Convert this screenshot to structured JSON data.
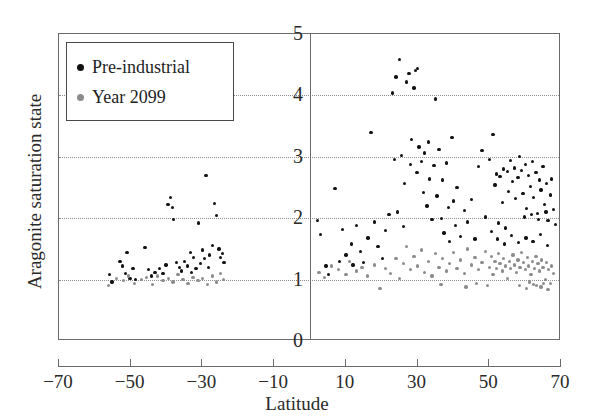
{
  "chart_data": {
    "type": "scatter",
    "title": "",
    "xlabel": "Latitude",
    "ylabel": "Aragonite saturation state",
    "xlim": [
      -70,
      70
    ],
    "ylim": [
      0,
      5
    ],
    "xticks": [
      -70,
      -50,
      -30,
      -10,
      10,
      30,
      50,
      70
    ],
    "yticks": [
      0,
      1,
      2,
      3,
      4,
      5
    ],
    "grid": "horizontal-dotted",
    "gridlines_y": [
      1,
      2,
      3,
      4
    ],
    "legend_position": "top-left-inside",
    "vertical_reference_line_x": 0,
    "series": [
      {
        "name": "Pre-industrial",
        "color": "#121212",
        "points": [
          [
            -56.0,
            1.08
          ],
          [
            -55.2,
            0.96
          ],
          [
            -53.0,
            1.3
          ],
          [
            -52.2,
            1.22
          ],
          [
            -51.4,
            1.1
          ],
          [
            -51.0,
            1.44
          ],
          [
            -50.2,
            1.02
          ],
          [
            -49.4,
            1.18
          ],
          [
            -48.6,
            1.0
          ],
          [
            -46.0,
            1.52
          ],
          [
            -45.0,
            1.16
          ],
          [
            -44.2,
            1.06
          ],
          [
            -43.2,
            1.12
          ],
          [
            -42.0,
            1.18
          ],
          [
            -41.0,
            1.1
          ],
          [
            -40.2,
            1.24
          ],
          [
            -39.6,
            2.22
          ],
          [
            -39.0,
            2.34
          ],
          [
            -38.4,
            2.18
          ],
          [
            -38.0,
            1.98
          ],
          [
            -37.2,
            1.28
          ],
          [
            -36.4,
            1.2
          ],
          [
            -35.8,
            1.14
          ],
          [
            -35.0,
            1.3
          ],
          [
            -34.2,
            1.22
          ],
          [
            -33.4,
            1.44
          ],
          [
            -33.0,
            1.12
          ],
          [
            -32.4,
            1.36
          ],
          [
            -31.8,
            1.18
          ],
          [
            -31.0,
            1.92
          ],
          [
            -30.6,
            1.26
          ],
          [
            -30.0,
            1.48
          ],
          [
            -29.4,
            1.34
          ],
          [
            -29.0,
            2.7
          ],
          [
            -28.4,
            1.2
          ],
          [
            -28.0,
            1.4
          ],
          [
            -27.2,
            1.56
          ],
          [
            -26.6,
            2.24
          ],
          [
            -26.0,
            2.04
          ],
          [
            -25.4,
            1.5
          ],
          [
            -25.0,
            1.36
          ],
          [
            -24.4,
            1.42
          ],
          [
            -24.0,
            1.28
          ],
          [
            2.0,
            1.96
          ],
          [
            3.0,
            1.74
          ],
          [
            4.5,
            1.22
          ],
          [
            5.2,
            1.08
          ],
          [
            7.0,
            2.48
          ],
          [
            8.2,
            1.3
          ],
          [
            9.0,
            1.82
          ],
          [
            10.0,
            1.4
          ],
          [
            11.5,
            1.58
          ],
          [
            12.0,
            1.24
          ],
          [
            13.0,
            1.88
          ],
          [
            14.0,
            1.46
          ],
          [
            15.0,
            1.28
          ],
          [
            16.2,
            1.68
          ],
          [
            17.0,
            3.4
          ],
          [
            18.0,
            1.94
          ],
          [
            19.0,
            1.54
          ],
          [
            20.2,
            1.34
          ],
          [
            21.0,
            1.8
          ],
          [
            22.0,
            2.06
          ],
          [
            23.0,
            4.04
          ],
          [
            23.6,
            2.96
          ],
          [
            24.0,
            4.3
          ],
          [
            24.4,
            2.1
          ],
          [
            25.0,
            4.58
          ],
          [
            25.6,
            3.02
          ],
          [
            26.0,
            1.86
          ],
          [
            26.4,
            2.56
          ],
          [
            27.0,
            4.22
          ],
          [
            27.6,
            4.36
          ],
          [
            28.0,
            2.88
          ],
          [
            28.4,
            3.28
          ],
          [
            29.0,
            4.12
          ],
          [
            29.4,
            4.4
          ],
          [
            29.8,
            2.74
          ],
          [
            30.0,
            4.44
          ],
          [
            30.4,
            3.16
          ],
          [
            31.0,
            2.92
          ],
          [
            31.6,
            2.42
          ],
          [
            32.0,
            3.06
          ],
          [
            32.6,
            2.2
          ],
          [
            33.0,
            3.24
          ],
          [
            33.4,
            2.64
          ],
          [
            34.0,
            1.98
          ],
          [
            34.6,
            2.86
          ],
          [
            35.0,
            3.94
          ],
          [
            35.4,
            2.36
          ],
          [
            36.0,
            3.12
          ],
          [
            36.6,
            2.0
          ],
          [
            37.0,
            2.62
          ],
          [
            37.4,
            1.76
          ],
          [
            38.0,
            2.9
          ],
          [
            38.6,
            2.18
          ],
          [
            39.0,
            1.62
          ],
          [
            39.6,
            3.32
          ],
          [
            40.0,
            2.28
          ],
          [
            40.6,
            1.88
          ],
          [
            41.0,
            2.5
          ],
          [
            42.0,
            1.7
          ],
          [
            43.0,
            2.12
          ],
          [
            44.0,
            1.94
          ],
          [
            45.0,
            2.3
          ],
          [
            46.0,
            1.66
          ],
          [
            47.0,
            2.84
          ],
          [
            48.0,
            3.1
          ],
          [
            49.0,
            2.02
          ],
          [
            50.0,
            2.96
          ],
          [
            50.6,
            1.78
          ],
          [
            51.0,
            3.36
          ],
          [
            51.6,
            2.54
          ],
          [
            52.0,
            2.72
          ],
          [
            52.6,
            1.92
          ],
          [
            53.0,
            2.68
          ],
          [
            53.6,
            2.26
          ],
          [
            54.0,
            2.8
          ],
          [
            54.6,
            1.84
          ],
          [
            55.0,
            2.76
          ],
          [
            55.4,
            2.44
          ],
          [
            56.0,
            2.94
          ],
          [
            56.4,
            2.6
          ],
          [
            57.0,
            2.82
          ],
          [
            57.4,
            2.32
          ],
          [
            58.0,
            2.66
          ],
          [
            58.4,
            3.0
          ],
          [
            59.0,
            2.78
          ],
          [
            59.4,
            2.4
          ],
          [
            60.0,
            2.88
          ],
          [
            60.4,
            2.16
          ],
          [
            61.0,
            2.7
          ],
          [
            61.4,
            2.52
          ],
          [
            62.0,
            2.92
          ],
          [
            62.4,
            2.34
          ],
          [
            63.0,
            2.74
          ],
          [
            63.4,
            2.08
          ],
          [
            64.0,
            2.62
          ],
          [
            64.4,
            2.46
          ],
          [
            65.0,
            2.84
          ],
          [
            65.4,
            2.22
          ],
          [
            66.0,
            2.56
          ],
          [
            66.4,
            1.96
          ],
          [
            67.0,
            2.38
          ],
          [
            67.4,
            2.64
          ],
          [
            68.0,
            2.14
          ],
          [
            68.4,
            1.9
          ],
          [
            52.2,
            1.66
          ],
          [
            54.2,
            1.58
          ],
          [
            56.2,
            1.72
          ],
          [
            58.2,
            1.6
          ],
          [
            60.2,
            1.68
          ],
          [
            62.2,
            1.62
          ],
          [
            64.2,
            1.74
          ],
          [
            66.2,
            1.56
          ],
          [
            59.8,
            2.02
          ],
          [
            61.8,
            2.06
          ],
          [
            63.8,
            1.98
          ],
          [
            65.8,
            2.1
          ]
        ]
      },
      {
        "name": "Year 2099",
        "color": "#8c8c8c",
        "points": [
          [
            -56.2,
            0.9
          ],
          [
            -54.0,
            1.02
          ],
          [
            -52.0,
            0.98
          ],
          [
            -50.6,
            1.06
          ],
          [
            -49.0,
            0.94
          ],
          [
            -47.0,
            1.0
          ],
          [
            -45.6,
            1.04
          ],
          [
            -44.0,
            0.92
          ],
          [
            -42.6,
            1.06
          ],
          [
            -41.0,
            0.98
          ],
          [
            -39.4,
            1.02
          ],
          [
            -38.2,
            0.96
          ],
          [
            -36.8,
            1.08
          ],
          [
            -35.4,
            1.0
          ],
          [
            -34.0,
            0.94
          ],
          [
            -32.6,
            1.04
          ],
          [
            -31.2,
            0.98
          ],
          [
            -30.0,
            1.02
          ],
          [
            -28.6,
            0.92
          ],
          [
            -27.2,
            1.06
          ],
          [
            -26.0,
            0.96
          ],
          [
            -25.0,
            1.1
          ],
          [
            -24.2,
            1.0
          ],
          [
            2.5,
            1.12
          ],
          [
            4.0,
            1.04
          ],
          [
            6.0,
            1.22
          ],
          [
            8.0,
            1.16
          ],
          [
            10.0,
            1.08
          ],
          [
            11.0,
            1.3
          ],
          [
            13.0,
            1.14
          ],
          [
            14.5,
            1.2
          ],
          [
            16.0,
            1.06
          ],
          [
            18.0,
            1.24
          ],
          [
            19.5,
            0.86
          ],
          [
            21.0,
            1.18
          ],
          [
            22.5,
            1.1
          ],
          [
            24.0,
            1.34
          ],
          [
            25.0,
            1.02
          ],
          [
            26.0,
            1.26
          ],
          [
            27.0,
            1.54
          ],
          [
            28.0,
            1.16
          ],
          [
            29.0,
            1.38
          ],
          [
            30.0,
            1.22
          ],
          [
            31.0,
            1.48
          ],
          [
            32.0,
            1.12
          ],
          [
            33.0,
            1.3
          ],
          [
            34.0,
            1.06
          ],
          [
            35.0,
            1.42
          ],
          [
            36.0,
            1.2
          ],
          [
            37.0,
            1.34
          ],
          [
            38.0,
            1.14
          ],
          [
            39.0,
            1.26
          ],
          [
            40.0,
            1.44
          ],
          [
            41.0,
            1.18
          ],
          [
            42.0,
            1.32
          ],
          [
            43.0,
            1.1
          ],
          [
            44.0,
            1.5
          ],
          [
            45.0,
            1.24
          ],
          [
            46.0,
            1.36
          ],
          [
            47.0,
            1.16
          ],
          [
            48.0,
            1.28
          ],
          [
            49.0,
            1.46
          ],
          [
            50.0,
            1.2
          ],
          [
            50.6,
            1.38
          ],
          [
            51.0,
            1.08
          ],
          [
            51.6,
            1.3
          ],
          [
            52.0,
            1.18
          ],
          [
            52.6,
            1.42
          ],
          [
            53.0,
            1.26
          ],
          [
            53.6,
            1.14
          ],
          [
            54.0,
            1.34
          ],
          [
            54.6,
            1.22
          ],
          [
            55.0,
            1.02
          ],
          [
            55.6,
            1.3
          ],
          [
            56.0,
            1.18
          ],
          [
            56.6,
            1.4
          ],
          [
            57.0,
            1.24
          ],
          [
            57.6,
            1.12
          ],
          [
            58.0,
            1.32
          ],
          [
            58.6,
            1.2
          ],
          [
            59.0,
            1.44
          ],
          [
            59.6,
            1.28
          ],
          [
            60.0,
            1.16
          ],
          [
            60.6,
            1.36
          ],
          [
            61.0,
            1.22
          ],
          [
            61.6,
            1.08
          ],
          [
            62.0,
            1.3
          ],
          [
            62.6,
            1.18
          ],
          [
            63.0,
            1.38
          ],
          [
            63.6,
            1.26
          ],
          [
            64.0,
            1.14
          ],
          [
            64.6,
            1.32
          ],
          [
            65.0,
            1.2
          ],
          [
            65.6,
            1.0
          ],
          [
            66.0,
            1.28
          ],
          [
            66.6,
            1.16
          ],
          [
            67.0,
            0.94
          ],
          [
            67.4,
            1.22
          ],
          [
            68.0,
            1.1
          ],
          [
            58.4,
            0.9
          ],
          [
            60.4,
            0.86
          ],
          [
            62.4,
            0.92
          ],
          [
            64.4,
            0.88
          ],
          [
            66.4,
            0.84
          ],
          [
            61.2,
            0.96
          ],
          [
            63.2,
            0.9
          ],
          [
            65.2,
            0.94
          ],
          [
            43.5,
            0.88
          ],
          [
            46.5,
            0.94
          ],
          [
            49.5,
            0.9
          ],
          [
            36.5,
            0.92
          ]
        ]
      }
    ]
  },
  "legend": {
    "items": [
      {
        "label": "Pre-industrial",
        "color": "#121212"
      },
      {
        "label": "Year 2099",
        "color": "#8c8c8c"
      }
    ]
  },
  "axes": {
    "x_label": "Latitude",
    "y_label": "Aragonite saturation state",
    "x_ticks": [
      "−70",
      "−50",
      "−30",
      "−10",
      "10",
      "30",
      "50",
      "70"
    ],
    "y_ticks": [
      "5",
      "4",
      "3",
      "2",
      "1",
      "0"
    ]
  }
}
